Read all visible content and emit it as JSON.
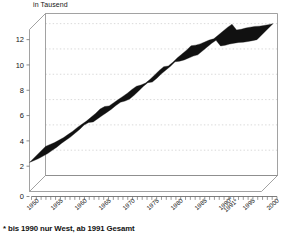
{
  "chart_data": {
    "type": "line",
    "title": "",
    "subtitle": "",
    "ylabel": "in Tausend",
    "xlabel": "",
    "ylim": [
      0,
      12.8
    ],
    "yticks": [
      0,
      2,
      4,
      6,
      8,
      10,
      12
    ],
    "xlim": [
      1950,
      2001
    ],
    "xticks": [
      1950,
      1955,
      1960,
      1965,
      1970,
      1975,
      1980,
      1985,
      1990,
      1995,
      2000
    ],
    "xtick_labels": [
      "1950",
      "1955",
      "1960",
      "1965",
      "1970",
      "1975",
      "1980",
      "1985",
      "1990*",
      "1991*",
      "1995",
      "2000"
    ],
    "grid": true,
    "grid_style": "dotted-horizontal",
    "legend": "none",
    "style": "3d-ribbon-line",
    "series": [
      {
        "name": "Bestand",
        "color": "#111111",
        "x": [
          1950,
          1951,
          1952,
          1953,
          1954,
          1955,
          1956,
          1957,
          1958,
          1959,
          1960,
          1961,
          1962,
          1963,
          1964,
          1965,
          1966,
          1967,
          1968,
          1969,
          1970,
          1971,
          1972,
          1973,
          1974,
          1975,
          1976,
          1977,
          1978,
          1979,
          1980,
          1981,
          1982,
          1983,
          1984,
          1985,
          1986,
          1987,
          1988,
          1989,
          1990,
          1991,
          1992,
          1993,
          1994,
          1995,
          1996,
          1997,
          1998,
          1999,
          2000
        ],
        "values": [
          2.3,
          2.45,
          2.6,
          2.8,
          3.0,
          3.25,
          3.5,
          3.8,
          4.05,
          4.3,
          4.6,
          4.9,
          5.25,
          5.45,
          5.5,
          5.75,
          6.0,
          6.25,
          6.5,
          6.8,
          7.05,
          7.15,
          7.3,
          7.6,
          7.95,
          8.3,
          8.6,
          8.65,
          8.95,
          9.3,
          9.6,
          9.9,
          10.25,
          10.3,
          10.4,
          10.55,
          10.7,
          10.8,
          11.1,
          11.4,
          11.7,
          11.95,
          11.5,
          11.55,
          11.65,
          11.72,
          11.78,
          11.8,
          11.85,
          11.92,
          12.0
        ]
      }
    ],
    "annotations": [
      {
        "text": "* bis 1990 nur West, ab 1991 Gesamt",
        "position": "below-axis"
      }
    ]
  },
  "footnote": "* bis 1990 nur West, ab 1991 Gesamt",
  "colors": {
    "series": "#111111",
    "frame": "#8a8a8a",
    "grid": "#c8c8c8",
    "text": "#151515"
  }
}
